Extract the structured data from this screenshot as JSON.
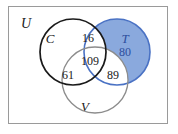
{
  "diagram": {
    "type": "venn-3-set",
    "title_label": "",
    "universal_set": {
      "label": "U",
      "description": "universal set rectangle"
    },
    "sets": [
      {
        "key": "C",
        "label": "C",
        "stroke_color": "#1a1a1a",
        "fill_color": "none",
        "label_color": "#1a1a1a"
      },
      {
        "key": "T",
        "label": "T",
        "stroke_color": "#4a72c4",
        "fill_color": "#8aa9dd",
        "label_color": "#2d4f9e"
      },
      {
        "key": "V",
        "label": "V",
        "stroke_color": "#8c8c8c",
        "fill_color": "none",
        "label_color": "#1a1a1a"
      }
    ],
    "regions": [
      {
        "key": "C_and_T_only",
        "value": "16",
        "text_color": "#1a1a1a"
      },
      {
        "key": "T_only",
        "value": "80",
        "text_color": "#2d4f9e"
      },
      {
        "key": "C_and_T_and_V",
        "value": "109",
        "text_color": "#1a1a1a"
      },
      {
        "key": "C_and_V_only",
        "value": "61",
        "text_color": "#1a1a1a"
      },
      {
        "key": "T_and_V_only",
        "value": "89",
        "text_color": "#1a1a1a"
      }
    ],
    "colors": {
      "frame_border": "#9a9a9a",
      "background": "#ffffff",
      "blue_fill": "#8aa9dd",
      "blue_stroke": "#4a72c4",
      "blue_text": "#2d4f9e",
      "black_stroke": "#1a1a1a",
      "gray_stroke": "#8c8c8c"
    }
  }
}
